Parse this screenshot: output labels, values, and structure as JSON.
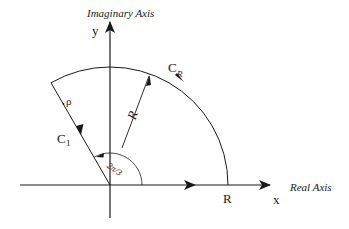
{
  "diagram": {
    "type": "contour-integration-sector",
    "axes": {
      "imaginary_axis_label": "Imaginary Axis",
      "real_axis_label": "Real Axis",
      "y_label": "y",
      "x_label": "x"
    },
    "contours": {
      "arc_label": "C",
      "arc_label_sub": "R",
      "ray_label": "C",
      "ray_label_sub": "1",
      "ray_variable": "ρ",
      "radius_label": "R",
      "angle_label": "2π/3",
      "x_intercept_label": "R"
    },
    "colors": {
      "stroke": "#1a1a1a",
      "background": "#ffffff"
    }
  }
}
